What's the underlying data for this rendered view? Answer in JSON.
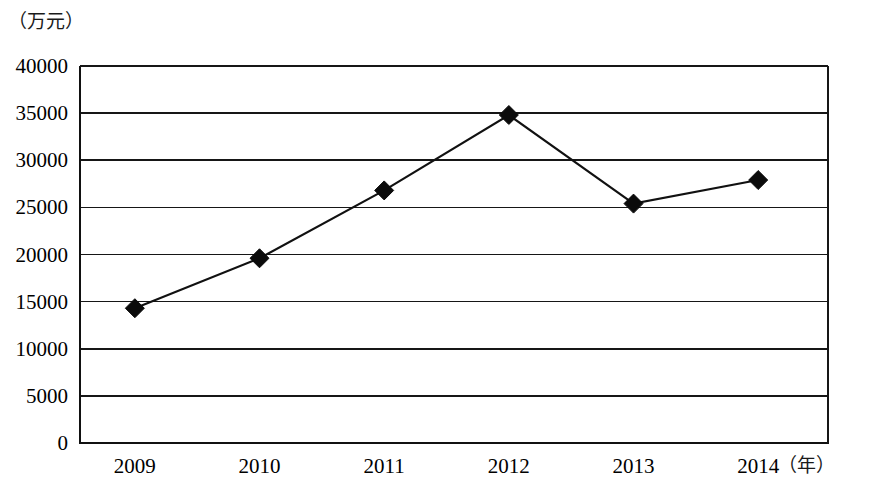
{
  "chart_data": {
    "type": "line",
    "title": "",
    "subtitle": "",
    "xlabel": "（年）",
    "ylabel": "（万元）",
    "categories": [
      "2009",
      "2010",
      "2011",
      "2012",
      "2013",
      "2014"
    ],
    "values": [
      14300,
      19600,
      26800,
      34800,
      25400,
      27900
    ],
    "series": [
      {
        "name": "",
        "values": [
          14300,
          19600,
          26800,
          34800,
          25400,
          27900
        ]
      }
    ],
    "ylim": [
      0,
      40000
    ],
    "ytick_labels": [
      "0",
      "5000",
      "10000",
      "15000",
      "20000",
      "25000",
      "30000",
      "35000",
      "40000"
    ],
    "ytick_values": [
      0,
      5000,
      10000,
      15000,
      20000,
      25000,
      30000,
      35000,
      40000
    ],
    "xtick_labels": [
      "2009",
      "2010",
      "2011",
      "2012",
      "2013",
      "2014"
    ],
    "grid": "horizontal",
    "legend": "none",
    "legend_position": "",
    "marker": "diamond",
    "line_color": "#111111",
    "marker_color": "#0b0b0b",
    "grid_color": "#161616",
    "background_color": "#ffffff",
    "annotations": []
  },
  "figure": {
    "y_unit_label": "（万元）",
    "x_unit_label": "（年）"
  }
}
